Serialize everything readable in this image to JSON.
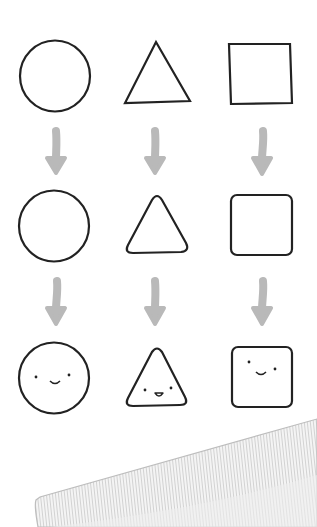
{
  "illustration": {
    "description": "Three shapes progressing from plain outlines to rounded outlines to smiling faces",
    "columns": [
      {
        "shape": "circle",
        "stages": [
          "plain",
          "plain",
          "smiling-face"
        ]
      },
      {
        "shape": "triangle",
        "stages": [
          "sharp-corners",
          "rounded-corners",
          "smiling-face"
        ]
      },
      {
        "shape": "square",
        "stages": [
          "sharp-corners",
          "rounded-corners",
          "smiling-face"
        ]
      }
    ],
    "colors": {
      "outline": "#222222",
      "arrow": "#b9b9b9",
      "background": "#ffffff",
      "fabric": "#e6e6e6"
    }
  }
}
